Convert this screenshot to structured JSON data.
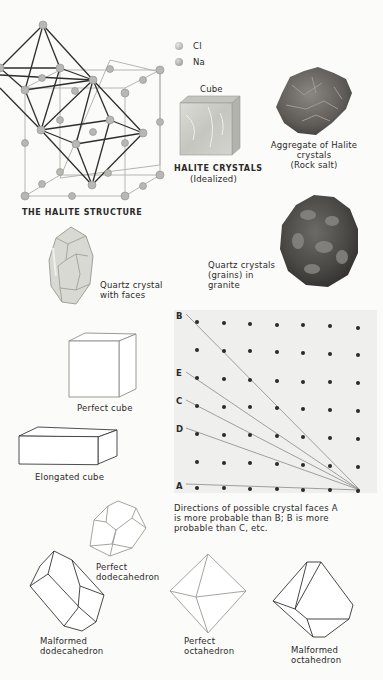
{
  "halite_structure": {
    "title": "THE HALITE STRUCTURE",
    "legend": [
      {
        "symbol": "Cl",
        "color": "#b9b9b6"
      },
      {
        "symbol": "Na",
        "color": "#a7a7a3"
      }
    ]
  },
  "halite_crystals": {
    "cube_label": "Cube",
    "title": "HALITE CRYSTALS",
    "subtitle": "(Idealized)"
  },
  "rock_salt": {
    "line1": "Aggregate of Halite",
    "line2": "crystals",
    "line3": "(Rock salt)"
  },
  "quartz_crystal": {
    "line1": "Quartz crystal",
    "line2": "with faces"
  },
  "quartz_granite": {
    "line1": "Quartz crystals",
    "line2": "(grains) in",
    "line3": "granite"
  },
  "shapes": {
    "perfect_cube": "Perfect cube",
    "elongated_cube": "Elongated cube",
    "perfect_dodecahedron": [
      "Perfect",
      "dodecahedron"
    ],
    "malformed_dodecahedron": [
      "Malformed",
      "dodecahedron"
    ],
    "perfect_octahedron": [
      "Perfect",
      "octahedron"
    ],
    "malformed_octahedron": [
      "Malformed",
      "octahedron"
    ]
  },
  "lattice_diagram": {
    "line_labels": [
      "B",
      "E",
      "C",
      "D",
      "A"
    ],
    "grid_rows": 7,
    "grid_cols": 7,
    "caption": {
      "line1": "Directions of possible crystal faces A",
      "line2": "is more probable than B; B is more",
      "line3": "probable than C, etc."
    }
  }
}
